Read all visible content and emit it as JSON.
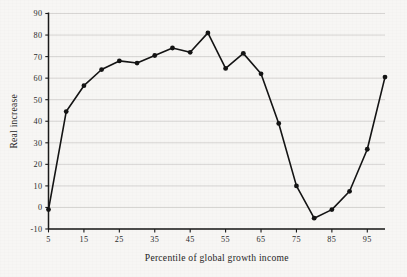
{
  "chart_data": {
    "type": "line",
    "title": "",
    "xlabel": "Percentile of global growth income",
    "ylabel": "Real increase",
    "x": [
      5,
      10,
      15,
      20,
      25,
      30,
      35,
      40,
      45,
      50,
      55,
      60,
      65,
      70,
      75,
      80,
      85,
      90,
      95,
      100
    ],
    "values": [
      -1,
      44.5,
      56.5,
      64,
      68,
      67,
      70.5,
      74,
      72,
      81,
      64.5,
      71.5,
      62,
      39,
      10,
      -5,
      -1,
      7.5,
      27,
      60.5
    ],
    "xlim": [
      5,
      100
    ],
    "ylim": [
      -10,
      90
    ],
    "xticks": [
      5,
      15,
      25,
      35,
      45,
      55,
      65,
      75,
      85,
      95
    ],
    "xtick_labels": [
      "5",
      "15",
      "25",
      "35",
      "45",
      "55",
      "65",
      "75",
      "85",
      "95"
    ],
    "yticks": [
      -10,
      0,
      10,
      20,
      30,
      40,
      50,
      60,
      70,
      80,
      90
    ],
    "ytick_labels": [
      "-10",
      "0",
      "10",
      "20",
      "30",
      "40",
      "50",
      "60",
      "70",
      "80",
      "90"
    ],
    "grid": "horizontal",
    "legend": "none",
    "marker": "filled-circle",
    "series_color": "#141414",
    "grid_color": "#c9c7c4",
    "background_color": "#f7f6f4"
  }
}
